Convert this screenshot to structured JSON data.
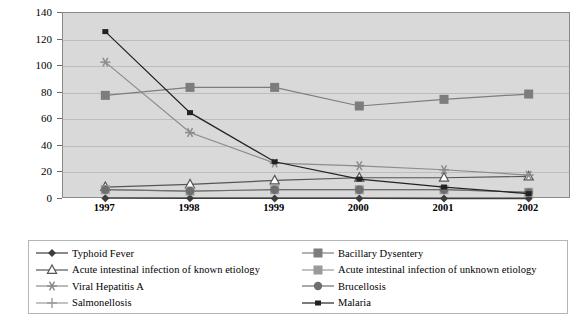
{
  "chart_data": {
    "type": "line",
    "title": "",
    "xlabel": "",
    "ylabel": "Cases per 100,000 population",
    "categories": [
      "1997",
      "1998",
      "1999",
      "2000",
      "2001",
      "2002"
    ],
    "ylim": [
      0,
      140
    ],
    "ytick_step": 20,
    "yticks": [
      "0",
      "20",
      "40",
      "60",
      "80",
      "100",
      "120",
      "140"
    ],
    "grid": true,
    "legend_position": "bottom",
    "plot_background": "#d9d9d9",
    "series": [
      {
        "name": "Typhoid Fever",
        "marker": "diamond",
        "color": "#3d3d3d",
        "values": [
          0.6,
          0.5,
          0.4,
          0.4,
          0.3,
          0.3
        ]
      },
      {
        "name": "Bacillary Dysentery",
        "marker": "square",
        "color": "#7d7d7d",
        "values": [
          78,
          84,
          84,
          70,
          75,
          79
        ]
      },
      {
        "name": "Acute intestinal infection of known etiology",
        "marker": "triangle-open",
        "color": "#555555",
        "values": [
          9,
          11,
          14,
          16,
          16,
          17
        ]
      },
      {
        "name": "Acute intestinal infection of unknown etiology",
        "marker": "square",
        "color": "#9a9a9a",
        "values": [
          7,
          6,
          7,
          7,
          7,
          5
        ]
      },
      {
        "name": "Viral Hepatitis A",
        "marker": "asterisk",
        "color": "#8c8c8c",
        "values": [
          103,
          50,
          27,
          25,
          22,
          18
        ]
      },
      {
        "name": "Brucellosis",
        "marker": "circle",
        "color": "#6e6e6e",
        "values": [
          7,
          6,
          7,
          7,
          7,
          5
        ]
      },
      {
        "name": "Malaria",
        "marker": "square-small",
        "color": "#222222",
        "values": [
          126,
          65,
          28,
          15,
          9,
          4
        ]
      }
    ]
  },
  "legend": {
    "left_column": [
      {
        "label": "Typhoid Fever",
        "marker": "diamond",
        "color": "#3d3d3d"
      },
      {
        "label": "Acute intestinal infection of known etiology",
        "marker": "triangle-open",
        "color": "#555555"
      },
      {
        "label": "Viral Hepatitis A",
        "marker": "asterisk",
        "color": "#8c8c8c"
      },
      {
        "label": "Salmonellosis",
        "marker": "plus",
        "color": "#9a9a9a"
      }
    ],
    "right_column": [
      {
        "label": "Bacillary Dysentery",
        "marker": "square",
        "color": "#7d7d7d"
      },
      {
        "label": "Acute intestinal infection of unknown etiology",
        "marker": "square",
        "color": "#9a9a9a"
      },
      {
        "label": "Brucellosis",
        "marker": "circle",
        "color": "#6e6e6e"
      },
      {
        "label": "Malaria",
        "marker": "square-small",
        "color": "#222222"
      }
    ]
  }
}
